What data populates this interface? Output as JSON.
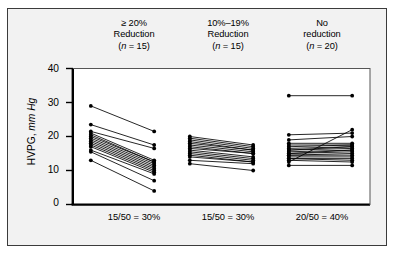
{
  "figure": {
    "background_color": "#f2f2f2",
    "frame_color": "#3b3b3b",
    "plot_background": "#ffffff",
    "ink_color": "#000000"
  },
  "axis": {
    "y_title_main": "HVPG, ",
    "y_title_italic": "mm Hg",
    "y_ticks": [
      "0",
      "10",
      "20",
      "30",
      "40"
    ]
  },
  "groups": [
    {
      "head_line1": "≥ 20%",
      "head_line2": "Reduction",
      "head_n_prefix": "(",
      "head_n_italic": "n",
      "head_n_suffix": " = 15)",
      "footer": "15/50 = 30%"
    },
    {
      "head_line1": "10%–19%",
      "head_line2": "Reduction",
      "head_n_prefix": "(",
      "head_n_italic": "n",
      "head_n_suffix": " = 15)",
      "footer": "15/50 = 30%"
    },
    {
      "head_line1": "No",
      "head_line2": "reduction",
      "head_n_prefix": "(",
      "head_n_italic": "n",
      "head_n_suffix": " = 20)",
      "footer": "20/50 = 40%"
    }
  ],
  "chart_data": {
    "type": "line",
    "title": "",
    "subtitle": "",
    "xlabel": "",
    "ylabel": "HVPG, mm Hg",
    "ylim": [
      0,
      40
    ],
    "yticks": [
      0,
      10,
      20,
      30,
      40
    ],
    "grid": false,
    "legend_position": "none",
    "x_categories": [
      "Baseline",
      "Follow-up"
    ],
    "series": [
      {
        "name": "≥ 20% Reduction (n = 15)",
        "x_positions": [
          0.18,
          0.82
        ],
        "pairs": [
          [
            29.0,
            21.5
          ],
          [
            23.5,
            17.5
          ],
          [
            21.5,
            16.5
          ],
          [
            21.0,
            13.0
          ],
          [
            20.5,
            12.5
          ],
          [
            20.0,
            12.5
          ],
          [
            19.5,
            12.0
          ],
          [
            19.0,
            11.5
          ],
          [
            18.5,
            11.0
          ],
          [
            18.0,
            10.5
          ],
          [
            17.5,
            10.0
          ],
          [
            17.0,
            9.5
          ],
          [
            16.0,
            9.0
          ],
          [
            15.5,
            7.0
          ],
          [
            13.0,
            4.0
          ]
        ]
      },
      {
        "name": "10%–19% Reduction (n = 15)",
        "x_positions": [
          0.18,
          0.82
        ],
        "pairs": [
          [
            20.0,
            17.5
          ],
          [
            19.5,
            17.0
          ],
          [
            19.0,
            16.5
          ],
          [
            18.5,
            16.0
          ],
          [
            18.0,
            16.0
          ],
          [
            17.5,
            15.5
          ],
          [
            17.0,
            15.0
          ],
          [
            16.5,
            15.0
          ],
          [
            16.0,
            14.0
          ],
          [
            15.5,
            13.5
          ],
          [
            15.0,
            13.0
          ],
          [
            14.5,
            12.5
          ],
          [
            14.0,
            12.5
          ],
          [
            13.0,
            12.0
          ],
          [
            12.0,
            10.0
          ]
        ]
      },
      {
        "name": "No reduction (n = 20)",
        "x_positions": [
          0.18,
          0.82
        ],
        "pairs": [
          [
            32.0,
            32.0
          ],
          [
            20.5,
            21.0
          ],
          [
            19.0,
            20.0
          ],
          [
            18.0,
            18.0
          ],
          [
            17.5,
            17.5
          ],
          [
            17.0,
            17.5
          ],
          [
            16.5,
            17.0
          ],
          [
            16.0,
            17.0
          ],
          [
            16.0,
            16.5
          ],
          [
            15.5,
            16.0
          ],
          [
            15.0,
            16.0
          ],
          [
            15.0,
            15.5
          ],
          [
            14.5,
            15.0
          ],
          [
            14.5,
            14.5
          ],
          [
            14.0,
            14.0
          ],
          [
            13.5,
            13.5
          ],
          [
            13.5,
            13.0
          ],
          [
            13.0,
            12.5
          ],
          [
            12.5,
            22.0
          ],
          [
            11.5,
            11.5
          ]
        ]
      }
    ]
  }
}
